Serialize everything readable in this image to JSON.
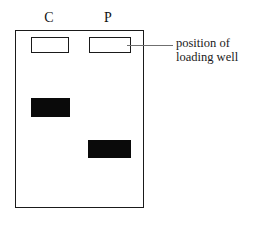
{
  "figure": {
    "type": "gel-electrophoresis-diagram",
    "background_color": "#ffffff",
    "ink_color": "#1a1a1a",
    "band_color": "#0a0a0a",
    "leader_color": "#6f6f6f"
  },
  "lanes": [
    {
      "id": "c",
      "label": "C"
    },
    {
      "id": "p",
      "label": "P"
    }
  ],
  "wells": [
    {
      "lane": "C",
      "name": "loading well"
    },
    {
      "lane": "P",
      "name": "loading well"
    }
  ],
  "bands": [
    {
      "lane": "C",
      "migration": "short"
    },
    {
      "lane": "P",
      "migration": "long"
    }
  ],
  "annotation": {
    "line1": "position of",
    "line2": "loading well"
  }
}
